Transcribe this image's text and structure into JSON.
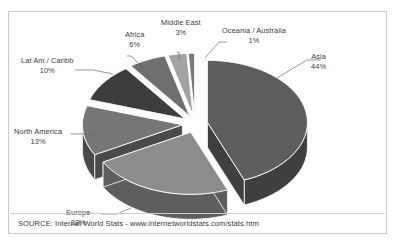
{
  "chart_data": {
    "type": "pie",
    "title": "",
    "subtitle": "",
    "xlabel": "",
    "ylabel": "",
    "legend_position": "callout-labels",
    "grid": false,
    "exploded": true,
    "three_d": true,
    "categories": [
      "Asia",
      "Europe",
      "North America",
      "Lat Am / Caribb",
      "Africa",
      "Middle East",
      "Oceania / Australia"
    ],
    "values": [
      44,
      23,
      13,
      10,
      6,
      3,
      1
    ],
    "unit": "%",
    "slices": [
      {
        "label": "Asia",
        "value": 44,
        "pct_text": "44%",
        "top_color": "#5e5e5e",
        "side_color": "#3f3f3f"
      },
      {
        "label": "Europe",
        "value": 23,
        "pct_text": "23%",
        "top_color": "#8c8c8c",
        "side_color": "#5e5e5e"
      },
      {
        "label": "North America",
        "value": 13,
        "pct_text": "13%",
        "top_color": "#767676",
        "side_color": "#4a4a4a"
      },
      {
        "label": "Lat Am / Caribb",
        "value": 10,
        "pct_text": "10%",
        "top_color": "#3d3d3d",
        "side_color": "#262626"
      },
      {
        "label": "Africa",
        "value": 6,
        "pct_text": "6%",
        "top_color": "#6f6f6f",
        "side_color": "#474747"
      },
      {
        "label": "Middle East",
        "value": 3,
        "pct_text": "3%",
        "top_color": "#a2a2a2",
        "side_color": "#6b6b6b"
      },
      {
        "label": "Oceania / Australia",
        "value": 1,
        "pct_text": "1%",
        "top_color": "#7a7a7a",
        "side_color": "#4f4f4f"
      }
    ]
  },
  "labels": {
    "asia": {
      "name": "Asia",
      "pct": "44%"
    },
    "europe": {
      "name": "Europe",
      "pct": "23%"
    },
    "north_america": {
      "name": "North America",
      "pct": "13%"
    },
    "lat_am": {
      "name": "Lat Am / Caribb",
      "pct": "10%"
    },
    "africa": {
      "name": "Africa",
      "pct": "6%"
    },
    "middle_east": {
      "name": "Middle East",
      "pct": "3%"
    },
    "oceania": {
      "name": "Oceania / Australia",
      "pct": "1%"
    }
  },
  "source": {
    "text": "SOURCE: Internet World Stats - www.internetworldstats.com/stats.htm"
  },
  "colors": {
    "border": "#c9c9c9",
    "text": "#3a3a3a",
    "background": "#ffffff",
    "leader_line": "#6b6b6b"
  }
}
